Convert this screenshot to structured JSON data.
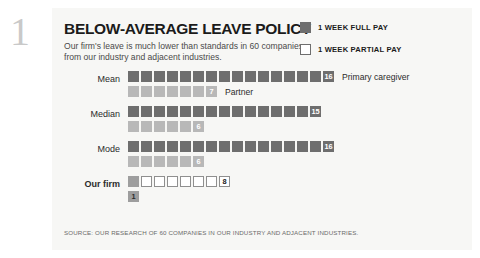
{
  "page_numeral": "1",
  "header": {
    "title": "BELOW-AVERAGE LEAVE POLICY",
    "subtitle": "Our firm's leave is much lower than standards in 60 companies from our industry and adjacent industries."
  },
  "legend": {
    "items": [
      {
        "label": "1 WEEK FULL PAY",
        "swatch": "filled-square-icon",
        "color": "#6e6e6e"
      },
      {
        "label": "1 WEEK PARTIAL PAY",
        "swatch": "outlined-square-icon",
        "color": "#ffffff"
      }
    ]
  },
  "source": "SOURCE: OUR RESEARCH OF 60 COMPANIES IN OUR INDUSTRY AND ADJACENT INDUSTRIES.",
  "chart_data": {
    "type": "bar",
    "title": "BELOW-AVERAGE LEAVE POLICY",
    "subtitle": "Our firm's leave is much lower than standards in 60 companies from our industry and adjacent industries.",
    "unit": "weeks of leave",
    "xlabel": "",
    "ylabel": "",
    "grid": false,
    "legend_position": "top-right",
    "categories": [
      "Mean",
      "Median",
      "Mode",
      "Our firm"
    ],
    "series": [
      {
        "name": "Primary caregiver",
        "values": [
          16,
          15,
          16,
          8
        ]
      },
      {
        "name": "Partner",
        "values": [
          7,
          6,
          6,
          1
        ]
      }
    ],
    "groups": [
      {
        "label": "Mean",
        "bold": false,
        "rows": [
          {
            "series": "Primary caregiver",
            "value": 16,
            "value_text": "16",
            "full_pay": 16,
            "partial_pay": 0,
            "side_label": "Primary caregiver"
          },
          {
            "series": "Partner",
            "value": 7,
            "value_text": "7",
            "full_pay": 7,
            "partial_pay": 0,
            "side_label": "Partner"
          }
        ]
      },
      {
        "label": "Median",
        "bold": false,
        "rows": [
          {
            "series": "Primary caregiver",
            "value": 15,
            "value_text": "15",
            "full_pay": 15,
            "partial_pay": 0,
            "side_label": ""
          },
          {
            "series": "Partner",
            "value": 6,
            "value_text": "6",
            "full_pay": 6,
            "partial_pay": 0,
            "side_label": ""
          }
        ]
      },
      {
        "label": "Mode",
        "bold": false,
        "rows": [
          {
            "series": "Primary caregiver",
            "value": 16,
            "value_text": "16",
            "full_pay": 16,
            "partial_pay": 0,
            "side_label": ""
          },
          {
            "series": "Partner",
            "value": 6,
            "value_text": "6",
            "full_pay": 6,
            "partial_pay": 0,
            "side_label": ""
          }
        ]
      },
      {
        "label": "Our firm",
        "bold": true,
        "rows": [
          {
            "series": "Primary caregiver",
            "value": 8,
            "value_text": "8",
            "full_pay": 1,
            "partial_pay": 7,
            "side_label": ""
          },
          {
            "series": "Partner",
            "value": 1,
            "value_text": "1",
            "full_pay": 1,
            "partial_pay": 0,
            "side_label": ""
          }
        ]
      }
    ]
  },
  "colors": {
    "full_pay": "#6e6e6e",
    "partial_pay_fill": "#b8b8b8",
    "empty_outline": "#8f8f8f",
    "card_background": "#f7f7f5",
    "text": "#1b1b1b"
  }
}
